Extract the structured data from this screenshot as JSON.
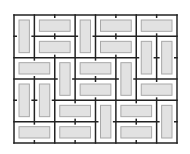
{
  "diagram": {
    "type": "domino-tiling",
    "grid": {
      "cols": 8,
      "rows": 6,
      "x0": 14,
      "y0": 15,
      "x1": 177,
      "y1": 143
    },
    "colors": {
      "background": "#ffffff",
      "grid_line": "#222222",
      "domino_fill": "#e2e2e2",
      "domino_stroke": "#a8a8a8"
    },
    "dominoes": [
      {
        "orientation": "vertical",
        "col": 0,
        "row": 0
      },
      {
        "orientation": "horizontal",
        "col": 1,
        "row": 0
      },
      {
        "orientation": "vertical",
        "col": 3,
        "row": 0
      },
      {
        "orientation": "horizontal",
        "col": 4,
        "row": 0
      },
      {
        "orientation": "horizontal",
        "col": 6,
        "row": 0
      },
      {
        "orientation": "horizontal",
        "col": 1,
        "row": 1
      },
      {
        "orientation": "horizontal",
        "col": 4,
        "row": 1
      },
      {
        "orientation": "vertical",
        "col": 6,
        "row": 1
      },
      {
        "orientation": "vertical",
        "col": 7,
        "row": 1
      },
      {
        "orientation": "horizontal",
        "col": 0,
        "row": 2
      },
      {
        "orientation": "vertical",
        "col": 2,
        "row": 2
      },
      {
        "orientation": "horizontal",
        "col": 3,
        "row": 2
      },
      {
        "orientation": "vertical",
        "col": 5,
        "row": 2
      },
      {
        "orientation": "vertical",
        "col": 0,
        "row": 3
      },
      {
        "orientation": "vertical",
        "col": 1,
        "row": 3
      },
      {
        "orientation": "horizontal",
        "col": 3,
        "row": 3
      },
      {
        "orientation": "horizontal",
        "col": 6,
        "row": 3
      },
      {
        "orientation": "horizontal",
        "col": 2,
        "row": 4
      },
      {
        "orientation": "vertical",
        "col": 4,
        "row": 4
      },
      {
        "orientation": "horizontal",
        "col": 5,
        "row": 4
      },
      {
        "orientation": "vertical",
        "col": 7,
        "row": 4
      },
      {
        "orientation": "horizontal",
        "col": 0,
        "row": 5
      },
      {
        "orientation": "horizontal",
        "col": 2,
        "row": 5
      },
      {
        "orientation": "horizontal",
        "col": 5,
        "row": 5
      }
    ]
  }
}
